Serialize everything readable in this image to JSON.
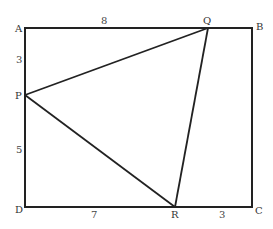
{
  "diagram": {
    "type": "geometry",
    "rectangle": {
      "vertices": [
        "A",
        "B",
        "C",
        "D"
      ]
    },
    "triangle": {
      "vertices": [
        "P",
        "Q",
        "R"
      ]
    },
    "points": {
      "A": {
        "label": "A",
        "x": 25,
        "y": 28
      },
      "B": {
        "label": "B",
        "x": 252,
        "y": 28
      },
      "C": {
        "label": "C",
        "x": 252,
        "y": 207
      },
      "D": {
        "label": "D",
        "x": 25,
        "y": 207
      },
      "P": {
        "label": "P",
        "x": 25,
        "y": 95
      },
      "Q": {
        "label": "Q",
        "x": 208,
        "y": 28
      },
      "R": {
        "label": "R",
        "x": 175,
        "y": 207
      }
    },
    "measurements": {
      "AQ": {
        "segment": "AQ",
        "label": "8"
      },
      "AP": {
        "segment": "AP",
        "label": "3"
      },
      "PD": {
        "segment": "PD",
        "label": "5"
      },
      "DR": {
        "segment": "DR",
        "label": "7"
      },
      "RC": {
        "segment": "RC",
        "label": "3"
      }
    }
  }
}
